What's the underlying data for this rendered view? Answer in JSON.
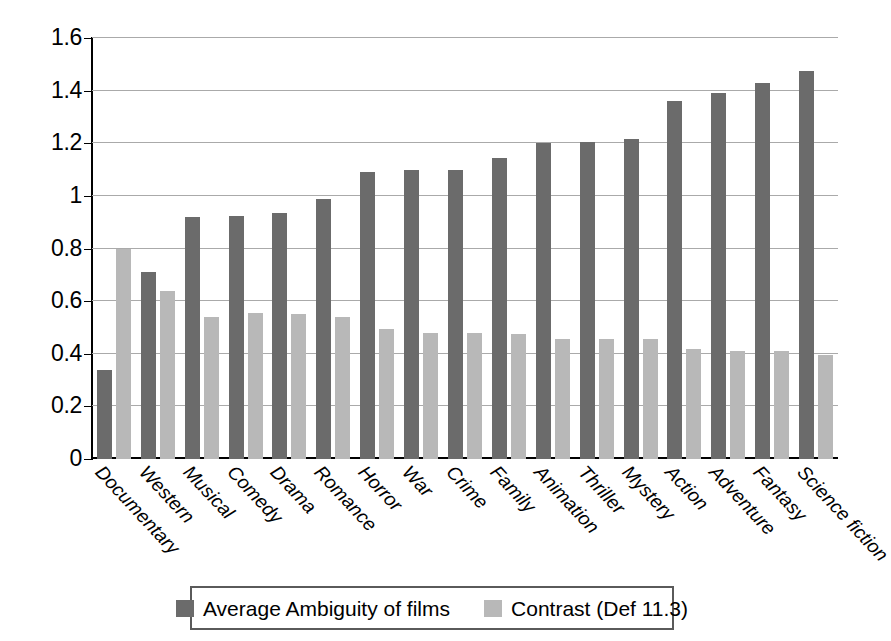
{
  "chart_data": {
    "type": "bar",
    "title": "",
    "subtitle": "",
    "xlabel": "",
    "ylabel": "",
    "ylim": [
      0,
      1.6
    ],
    "yticks": [
      "0",
      "0.2",
      "0.4",
      "0.6",
      "0.8",
      "1",
      "1.2",
      "1.4",
      "1.6"
    ],
    "ytick_values": [
      0,
      0.2,
      0.4,
      0.6,
      0.8,
      1.0,
      1.2,
      1.4,
      1.6
    ],
    "grid": true,
    "legend_position": "bottom",
    "categories": [
      "Documentary",
      "Western",
      "Musical",
      "Comedy",
      "Drama",
      "Romance",
      "Horror",
      "War",
      "Crime",
      "Family",
      "Animation",
      "Thriller",
      "Mystery",
      "Action",
      "Adventure",
      "Fantasy",
      "Science fiction"
    ],
    "series": [
      {
        "name": "Average Ambiguity of films",
        "color": "#6b6b6b",
        "values": [
          0.34,
          0.71,
          0.92,
          0.925,
          0.935,
          0.99,
          1.09,
          1.1,
          1.1,
          1.145,
          1.2,
          1.205,
          1.215,
          1.36,
          1.39,
          1.43,
          1.475
        ]
      },
      {
        "name": "Contrast (Def 11.3)",
        "color": "#b8b8b8",
        "values": [
          0.8,
          0.64,
          0.54,
          0.555,
          0.55,
          0.54,
          0.495,
          0.48,
          0.48,
          0.475,
          0.455,
          0.455,
          0.455,
          0.42,
          0.41,
          0.41,
          0.395
        ]
      }
    ]
  },
  "legend": {
    "entries": [
      {
        "label": "Average Ambiguity of films"
      },
      {
        "label": "Contrast (Def 11.3)"
      }
    ]
  },
  "colors": {
    "series_0": "#6b6b6b",
    "series_1": "#b8b8b8",
    "grid": "#aaaaaa",
    "axis": "#000000",
    "background": "#ffffff"
  }
}
